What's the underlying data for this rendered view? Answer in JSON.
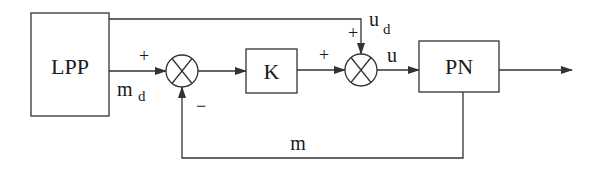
{
  "diagram": {
    "type": "block-diagram",
    "blocks": {
      "lpp": {
        "label": "LPP"
      },
      "k": {
        "label": "K"
      },
      "pn": {
        "label": "PN"
      }
    },
    "junctions": {
      "sum1": {
        "plus_sign": "+",
        "minus_sign": "−"
      },
      "sum2": {
        "plus_left_sign": "+",
        "plus_top_sign": "+"
      }
    },
    "signals": {
      "md": {
        "main": "m",
        "sub": "d"
      },
      "ud": {
        "main": "u",
        "sub": "d"
      },
      "u": {
        "label": "u"
      },
      "m": {
        "label": "m"
      }
    },
    "colors": {
      "stroke": "#333333",
      "text": "#1a1a1a",
      "background": "#ffffff"
    }
  }
}
